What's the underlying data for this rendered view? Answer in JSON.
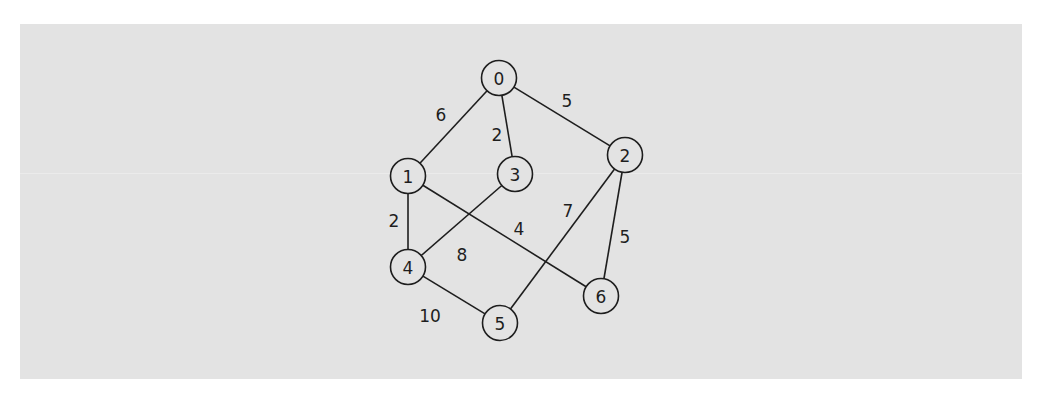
{
  "diagram": {
    "type": "weighted-undirected-graph",
    "background_color": "#e3e3e3",
    "stroke_color": "#1e1e1e",
    "nodes": [
      {
        "id": "0",
        "label": "0",
        "x": 499,
        "y": 78
      },
      {
        "id": "1",
        "label": "1",
        "x": 408,
        "y": 176
      },
      {
        "id": "2",
        "label": "2",
        "x": 625,
        "y": 155
      },
      {
        "id": "3",
        "label": "3",
        "x": 515,
        "y": 174
      },
      {
        "id": "4",
        "label": "4",
        "x": 408,
        "y": 267
      },
      {
        "id": "5",
        "label": "5",
        "x": 500,
        "y": 323
      },
      {
        "id": "6",
        "label": "6",
        "x": 601,
        "y": 296
      }
    ],
    "edges": [
      {
        "from": "0",
        "to": "1",
        "weight": "6",
        "label_x": 441,
        "label_y": 115
      },
      {
        "from": "0",
        "to": "3",
        "weight": "2",
        "label_x": 497,
        "label_y": 135
      },
      {
        "from": "0",
        "to": "2",
        "weight": "5",
        "label_x": 567,
        "label_y": 101
      },
      {
        "from": "1",
        "to": "4",
        "weight": "2",
        "label_x": 394,
        "label_y": 221
      },
      {
        "from": "1",
        "to": "6",
        "weight": "4",
        "label_x": 519,
        "label_y": 229
      },
      {
        "from": "3",
        "to": "4",
        "weight": "8",
        "label_x": 462,
        "label_y": 255
      },
      {
        "from": "2",
        "to": "5",
        "weight": "7",
        "label_x": 568,
        "label_y": 211
      },
      {
        "from": "2",
        "to": "6",
        "weight": "5",
        "label_x": 625,
        "label_y": 237
      },
      {
        "from": "4",
        "to": "5",
        "weight": "10",
        "label_x": 430,
        "label_y": 316
      }
    ]
  }
}
